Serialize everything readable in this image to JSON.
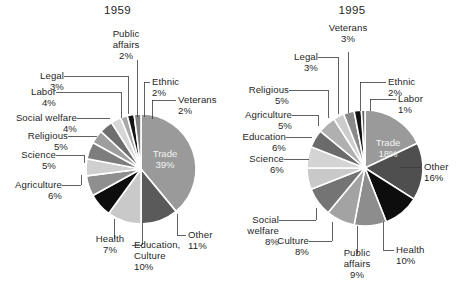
{
  "figure": {
    "background_color": "#ffffff",
    "text_color": "#1f1f1f"
  },
  "charts": [
    {
      "id": "chart-1959",
      "title": "1959",
      "center": [
        141,
        169
      ],
      "radius": 55
    },
    {
      "id": "chart-1995",
      "title": "1995",
      "center": [
        365,
        168
      ],
      "radius": 58
    }
  ],
  "chart_data": [
    {
      "type": "pie",
      "title": "1959",
      "value_unit": "percent",
      "labels": [
        "Trade",
        "Other",
        "Education, Culture",
        "Health",
        "Agriculture",
        "Science",
        "Religious",
        "Social welfare",
        "Labor",
        "Legal",
        "Public affairs",
        "Ethnic",
        "Veterans"
      ],
      "values": [
        39,
        11,
        10,
        7,
        6,
        5,
        5,
        4,
        4,
        3,
        2,
        2,
        2
      ],
      "colors": [
        "#9a9a9a",
        "#5a5a5a",
        "#c9c9c9",
        "#0d0d0d",
        "#8f8f8f",
        "#cfcfcf",
        "#7d7d7d",
        "#9d9d9d",
        "#6e6e6e",
        "#d6d6d6",
        "#a8a8a8",
        "#151515",
        "#828282"
      ],
      "start_angle_deg": -90,
      "direction": "clockwise",
      "legend": "callout-labels",
      "slice_label_inside": [
        "Trade"
      ],
      "annotations": [
        {
          "label": "Trade",
          "value": "39%",
          "placement": "inside"
        },
        {
          "label": "Other",
          "value": "11%",
          "placement": "outside-bottom-right"
        },
        {
          "label": "Education, Culture",
          "value": "10%",
          "placement": "outside-bottom"
        },
        {
          "label": "Health",
          "value": "7%",
          "placement": "outside-bottom-left"
        },
        {
          "label": "Agriculture",
          "value": "6%",
          "placement": "outside-left"
        },
        {
          "label": "Science",
          "value": "5%",
          "placement": "outside-left"
        },
        {
          "label": "Religious",
          "value": "5%",
          "placement": "outside-left"
        },
        {
          "label": "Social welfare",
          "value": "4%",
          "placement": "outside-left"
        },
        {
          "label": "Labor",
          "value": "4%",
          "placement": "outside-left"
        },
        {
          "label": "Legal",
          "value": "3%",
          "placement": "outside-top-left"
        },
        {
          "label": "Public affairs",
          "value": "2%",
          "placement": "outside-top"
        },
        {
          "label": "Ethnic",
          "value": "2%",
          "placement": "outside-top-right"
        },
        {
          "label": "Veterans",
          "value": "2%",
          "placement": "outside-right"
        }
      ]
    },
    {
      "type": "pie",
      "title": "1995",
      "value_unit": "percent",
      "labels": [
        "Trade",
        "Other",
        "Health",
        "Public affairs",
        "Culture",
        "Social welfare",
        "Science",
        "Education",
        "Agriculture",
        "Religious",
        "Legal",
        "Veterans",
        "Ethnic",
        "Labor"
      ],
      "values": [
        18,
        16,
        10,
        9,
        8,
        8,
        6,
        6,
        5,
        5,
        3,
        3,
        2,
        1
      ],
      "colors": [
        "#9a9a9a",
        "#4f4f4f",
        "#0d0d0d",
        "#8d8d8d",
        "#a3a3a3",
        "#747474",
        "#c9c9c9",
        "#d4d4d4",
        "#6b6b6b",
        "#b0b0b0",
        "#cccccc",
        "#8a8a8a",
        "#111111",
        "#5e5e5e"
      ],
      "start_angle_deg": -90,
      "direction": "clockwise",
      "legend": "callout-labels",
      "slice_label_inside": [
        "Trade"
      ],
      "annotations": [
        {
          "label": "Trade",
          "value": "18%",
          "placement": "inside"
        },
        {
          "label": "Other",
          "value": "16%",
          "placement": "outside-right"
        },
        {
          "label": "Health",
          "value": "10%",
          "placement": "outside-bottom-right"
        },
        {
          "label": "Public affairs",
          "value": "9%",
          "placement": "outside-bottom"
        },
        {
          "label": "Culture",
          "value": "8%",
          "placement": "outside-bottom-left"
        },
        {
          "label": "Social welfare",
          "value": "8%",
          "placement": "outside-left"
        },
        {
          "label": "Science",
          "value": "6%",
          "placement": "outside-left"
        },
        {
          "label": "Education",
          "value": "6%",
          "placement": "outside-left"
        },
        {
          "label": "Agriculture",
          "value": "5%",
          "placement": "outside-left"
        },
        {
          "label": "Religious",
          "value": "5%",
          "placement": "outside-left"
        },
        {
          "label": "Legal",
          "value": "3%",
          "placement": "outside-top-left"
        },
        {
          "label": "Veterans",
          "value": "3%",
          "placement": "outside-top"
        },
        {
          "label": "Ethnic",
          "value": "2%",
          "placement": "outside-top-right"
        },
        {
          "label": "Labor",
          "value": "1%",
          "placement": "outside-right"
        }
      ]
    }
  ],
  "labels_1959": {
    "public_affairs_name": "Public",
    "public_affairs_name2": "affairs",
    "public_affairs_pct": "2%",
    "legal_name": "Legal",
    "legal_pct": "3%",
    "ethnic_name": "Ethnic",
    "ethnic_pct": "2%",
    "labor_name": "Labor",
    "labor_pct": "4%",
    "veterans_name": "Veterans",
    "veterans_pct": "2%",
    "social_welfare_name": "Social welfare",
    "social_welfare_pct": "4%",
    "religious_name": "Religious",
    "religious_pct": "5%",
    "science_name": "Science",
    "science_pct": "5%",
    "agriculture_name": "Agriculture",
    "agriculture_pct": "6%",
    "health_name": "Health",
    "health_pct": "7%",
    "education_name": "Education,",
    "education_name2": "Culture",
    "education_pct": "10%",
    "other_name": "Other",
    "other_pct": "11%",
    "trade_name": "Trade",
    "trade_pct": "39%"
  },
  "labels_1995": {
    "veterans_name": "Veterans",
    "veterans_pct": "3%",
    "legal_name": "Legal",
    "legal_pct": "3%",
    "ethnic_name": "Ethnic",
    "ethnic_pct": "2%",
    "religious_name": "Religious",
    "religious_pct": "5%",
    "labor_name": "Labor",
    "labor_pct": "1%",
    "agriculture_name": "Agriculture",
    "agriculture_pct": "5%",
    "education_name": "Education",
    "education_pct": "6%",
    "other_name": "Other",
    "other_pct": "16%",
    "science_name": "Science",
    "science_pct": "6%",
    "social_welfare_name": "Social",
    "social_welfare_name2": "welfare",
    "social_welfare_pct": "8%",
    "culture_name": "Culture",
    "culture_pct": "8%",
    "health_name": "Health",
    "health_pct": "10%",
    "public_affairs_name": "Public",
    "public_affairs_name2": "affairs",
    "public_affairs_pct": "9%",
    "trade_name": "Trade",
    "trade_pct": "18%"
  }
}
